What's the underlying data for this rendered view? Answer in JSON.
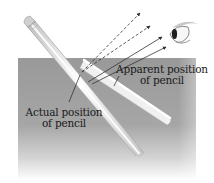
{
  "diagram": {
    "labels": {
      "apparent": {
        "line1": "Apparent position",
        "line2": "of pencil"
      },
      "actual": {
        "line1": "Actual position",
        "line2": "of pencil"
      }
    },
    "elements": {
      "water": {
        "color_top": "#9a9a9a",
        "color_bottom": "#ffffff"
      },
      "pencil": {
        "body_color": "#f2f2f2",
        "shade_color": "#b8b8b8",
        "eraser_color": "#d6d6d6"
      },
      "rays": {
        "dashed_count": 2,
        "solid_count": 2,
        "color": "#333333"
      },
      "eye": {
        "semantic": "eye-icon"
      }
    }
  }
}
